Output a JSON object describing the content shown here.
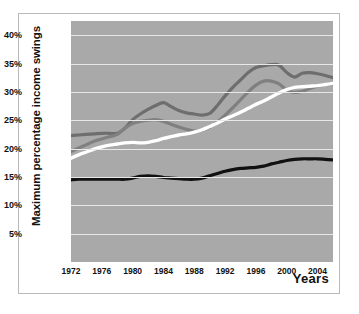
{
  "chart_data": {
    "type": "line",
    "title": "",
    "xlabel": "Years",
    "ylabel": "Maximum percentage income swings",
    "xlim": [
      1972,
      2006
    ],
    "ylim": [
      0,
      42.5
    ],
    "grid": true,
    "legend": "none",
    "background_color": "#a9a9a9",
    "gridline_color": "#e8e8e8",
    "ytick_labels": [
      "5%",
      "10%",
      "15%",
      "20%",
      "25%",
      "30%",
      "35%",
      "40%"
    ],
    "ytick_values": [
      5,
      10,
      15,
      20,
      25,
      30,
      35,
      40
    ],
    "xtick_labels": [
      "1972",
      "1976",
      "1980",
      "1984",
      "1988",
      "1992",
      "1996",
      "2000",
      "2004"
    ],
    "xtick_values": [
      1972,
      1976,
      1980,
      1984,
      1988,
      1992,
      1996,
      2000,
      2004
    ],
    "x": [
      1972,
      1973,
      1974,
      1975,
      1976,
      1977,
      1978,
      1979,
      1980,
      1981,
      1982,
      1983,
      1984,
      1985,
      1986,
      1987,
      1988,
      1989,
      1990,
      1991,
      1992,
      1993,
      1994,
      1995,
      1996,
      1997,
      1998,
      1999,
      2000,
      2001,
      2002,
      2003,
      2004,
      2005,
      2006
    ],
    "series": [
      {
        "name": "dark-gray-series",
        "color": "#6e6e6e",
        "width": 3.2,
        "values": [
          22.3,
          22.4,
          22.5,
          22.6,
          22.7,
          22.7,
          22.7,
          23.6,
          25.1,
          26.1,
          26.9,
          27.6,
          28.1,
          27.4,
          26.7,
          26.3,
          26.1,
          25.9,
          26.2,
          27.6,
          29.3,
          30.8,
          32.1,
          33.4,
          34.3,
          34.6,
          34.8,
          34.7,
          33.4,
          32.6,
          33.3,
          33.4,
          33.2,
          32.9,
          32.5
        ]
      },
      {
        "name": "medium-gray-series",
        "color": "#808080",
        "width": 3.2,
        "values": [
          19.5,
          20.1,
          20.7,
          21.3,
          21.7,
          22.1,
          22.5,
          23.6,
          24.4,
          24.8,
          25.0,
          25.1,
          24.8,
          24.3,
          23.8,
          23.4,
          23.1,
          23.2,
          23.8,
          24.7,
          25.9,
          27.2,
          28.6,
          30.0,
          31.2,
          31.9,
          31.9,
          31.4,
          30.3,
          29.9,
          30.1,
          30.6,
          31.0,
          31.3,
          31.4
        ]
      },
      {
        "name": "white-series",
        "color": "#ffffff",
        "width": 3.4,
        "values": [
          18.3,
          18.9,
          19.4,
          19.9,
          20.3,
          20.6,
          20.8,
          21.0,
          21.1,
          21.0,
          21.1,
          21.4,
          21.8,
          22.1,
          22.4,
          22.6,
          22.9,
          23.3,
          23.9,
          24.5,
          25.2,
          25.8,
          26.4,
          27.1,
          27.8,
          28.4,
          29.1,
          29.8,
          30.4,
          30.8,
          30.9,
          31.0,
          31.1,
          31.3,
          31.5
        ]
      },
      {
        "name": "black-series",
        "color": "#111111",
        "width": 3.2,
        "values": [
          14.5,
          14.6,
          14.6,
          14.6,
          14.6,
          14.6,
          14.6,
          14.6,
          14.8,
          15.1,
          15.2,
          15.1,
          14.9,
          14.8,
          14.7,
          14.6,
          14.6,
          14.8,
          15.2,
          15.6,
          16.0,
          16.3,
          16.5,
          16.6,
          16.7,
          16.9,
          17.3,
          17.6,
          17.9,
          18.1,
          18.2,
          18.2,
          18.2,
          18.1,
          18.0
        ]
      }
    ]
  }
}
